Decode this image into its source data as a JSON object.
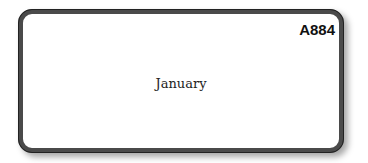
{
  "card": {
    "code": "A884",
    "label": "January"
  }
}
